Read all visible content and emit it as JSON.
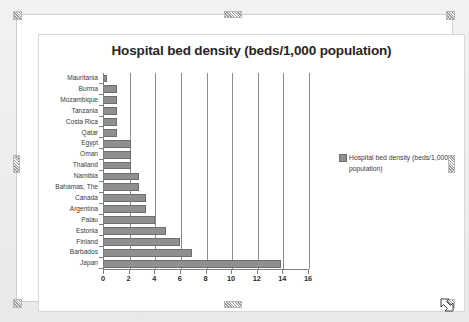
{
  "window": {
    "object_type": "chart-object-selected"
  },
  "chart_data": {
    "type": "bar",
    "orientation": "horizontal",
    "title": "Hospital bed density (beds/1,000 population)",
    "xlabel": "",
    "ylabel": "",
    "xlim": [
      0,
      16
    ],
    "xticks": [
      0,
      2,
      4,
      6,
      8,
      10,
      12,
      14,
      16
    ],
    "grid": true,
    "legend_position": "right",
    "series_name": "Hospital bed density (beds/1,000 population)",
    "series_color": "#8f8f8f",
    "categories": [
      "Mauritania",
      "Burma",
      "Mozambique",
      "Tanzania",
      "Costa Rica",
      "Qatar",
      "Egypt",
      "Oman",
      "Thailand",
      "Namibia",
      "Bahamas, The",
      "Canada",
      "Argentina",
      "Palau",
      "Estonia",
      "Finland",
      "Barbados",
      "Japan"
    ],
    "values": [
      0.2,
      1.0,
      1.0,
      1.0,
      1.0,
      1.0,
      2.1,
      2.1,
      2.1,
      2.7,
      2.7,
      3.3,
      3.3,
      4.0,
      4.8,
      5.9,
      6.9,
      13.8
    ],
    "series": [
      {
        "name": "Hospital bed density (beds/1,000 population)",
        "values": [
          0.2,
          1.0,
          1.0,
          1.0,
          1.0,
          1.0,
          2.1,
          2.1,
          2.1,
          2.7,
          2.7,
          3.3,
          3.3,
          4.0,
          4.8,
          5.9,
          6.9,
          13.8
        ]
      }
    ]
  },
  "legend": {
    "label": "Hospital bed density (beds/1,000 population)"
  }
}
